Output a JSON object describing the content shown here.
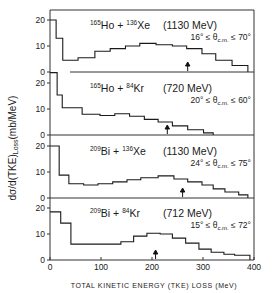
{
  "chart_data": {
    "type": "bar",
    "subtype": "stacked-panel step histograms",
    "xlabel": "TOTAL KINETIC ENERGY (TKE) LOSS (MeV)",
    "ylabel": "dσ/d(TKE)",
    "ylabel_subscript": "Loss",
    "ylabel_units": "(mb/MeV)",
    "xlim": [
      0,
      400
    ],
    "x_ticks": [
      0,
      100,
      200,
      300,
      400
    ],
    "y_ticks_per_panel": [
      0,
      10,
      20
    ],
    "ylim_per_panel": [
      0,
      24
    ],
    "grid": false,
    "legend": "none",
    "panels": [
      {
        "target": "Ho",
        "target_mass": "165",
        "projectile": "Xe",
        "projectile_mass": "136",
        "energy": "(1130 MeV)",
        "angle_low": "16°",
        "angle_high": "70°",
        "arrow_x": 270,
        "bin_edges": [
          0,
          12,
          25,
          55,
          88,
          118,
          148,
          176,
          208,
          240,
          268,
          298,
          325,
          357,
          388
        ],
        "values": [
          20,
          13,
          4.5,
          5.5,
          8,
          9,
          10,
          11,
          10.5,
          10,
          9,
          7,
          4.5,
          2.5
        ]
      },
      {
        "target": "Ho",
        "target_mass": "165",
        "projectile": "Kr",
        "projectile_mass": "84",
        "energy": "(720 MeV)",
        "angle_low": "20°",
        "angle_high": "60°",
        "arrow_x": 230,
        "bin_edges": [
          0,
          14,
          24,
          63,
          98,
          127,
          156,
          185,
          212,
          240,
          270,
          301,
          320
        ],
        "values": [
          24,
          15.4,
          10.5,
          8,
          7.5,
          8.2,
          7.2,
          6,
          5,
          3.5,
          2,
          0.8
        ]
      },
      {
        "target": "Bi",
        "target_mass": "209",
        "projectile": "Xe",
        "projectile_mass": "136",
        "energy": "(1130 MeV)",
        "angle_low": "24°",
        "angle_high": "75°",
        "arrow_x": 260,
        "bin_edges": [
          0,
          18,
          37,
          66,
          94,
          123,
          151,
          178,
          212,
          243,
          270,
          298,
          320,
          343,
          370,
          388
        ],
        "values": [
          20,
          8.8,
          5.5,
          5,
          5.5,
          6.2,
          7,
          7.8,
          8.5,
          7.3,
          6.2,
          5,
          3.5,
          2.3,
          1.2
        ]
      },
      {
        "target": "Bi",
        "target_mass": "209",
        "projectile": "Kr",
        "projectile_mass": "84",
        "energy": "(712 MeV)",
        "angle_low": "15°",
        "angle_high": "72°",
        "arrow_x": 207,
        "bin_edges": [
          0,
          21,
          41,
          139,
          164,
          190,
          216,
          240,
          266,
          292,
          316,
          341,
          362,
          392
        ],
        "values": [
          18.5,
          14.2,
          6.1,
          7,
          9.2,
          10.3,
          10,
          8.4,
          6.5,
          4.2,
          3,
          2.2,
          1.8
        ]
      }
    ]
  },
  "labels": {
    "plus": "+",
    "theta_cm": "θ",
    "theta_sub": "c.m.",
    "le": "≤"
  }
}
